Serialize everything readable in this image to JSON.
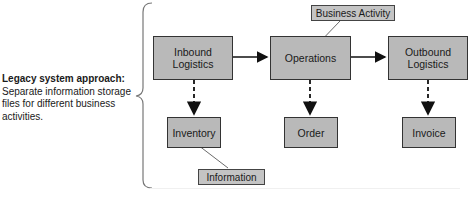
{
  "caption": {
    "title": "Legacy system approach:",
    "body": "Separate information storage files for different business activities."
  },
  "activities": [
    {
      "id": "inbound",
      "line1": "Inbound",
      "line2": "Logistics"
    },
    {
      "id": "operations",
      "line1": "Operations",
      "line2": ""
    },
    {
      "id": "outbound",
      "line1": "Outbound",
      "line2": "Logistics"
    }
  ],
  "storage": [
    {
      "id": "inventory",
      "label": "Inventory"
    },
    {
      "id": "order",
      "label": "Order"
    },
    {
      "id": "invoice",
      "label": "Invoice"
    }
  ],
  "callouts": {
    "business_activity": "Business Activity",
    "information": "Information"
  },
  "colors": {
    "box_fill": "#b9b9b9",
    "border": "#333333",
    "brace": "#777777"
  }
}
